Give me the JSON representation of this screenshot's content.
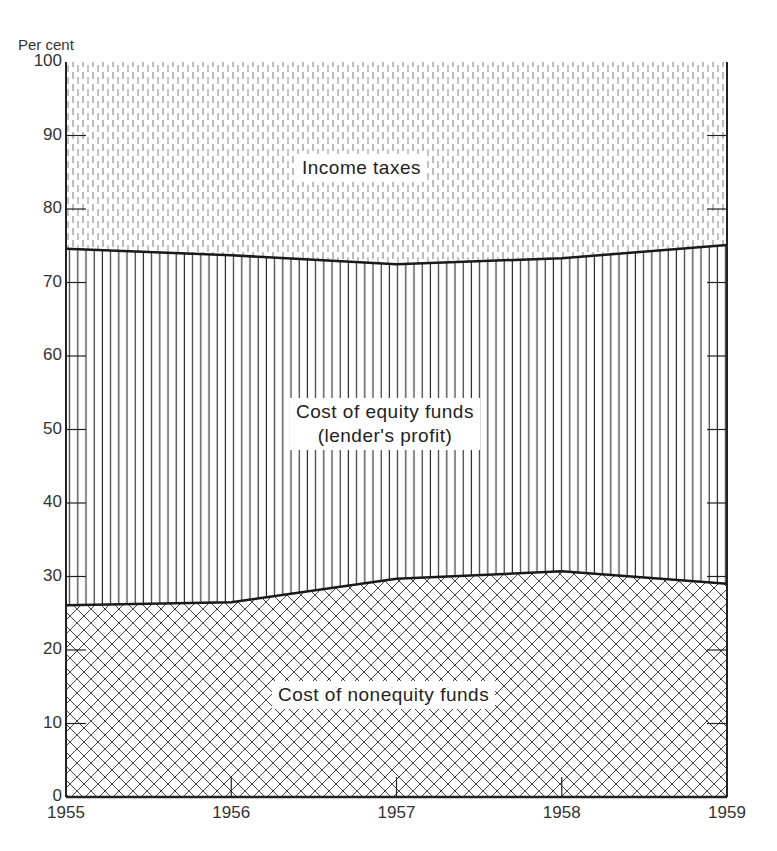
{
  "chart_data": {
    "type": "area",
    "stacked": true,
    "title": "",
    "xlabel": "",
    "ylabel": "Per cent",
    "x": [
      1955,
      1956,
      1957,
      1958,
      1959
    ],
    "ylim": [
      0,
      100
    ],
    "xlim": [
      1955,
      1959
    ],
    "yticks": [
      0,
      10,
      20,
      30,
      40,
      50,
      60,
      70,
      80,
      90,
      100
    ],
    "xticks": [
      1955,
      1956,
      1957,
      1958,
      1959
    ],
    "grid": false,
    "legend": "inline area labels",
    "series": [
      {
        "name": "Cost of nonequity funds",
        "values": [
          26.1,
          26.5,
          29.7,
          30.7,
          29.0
        ],
        "pattern": "crosshatch"
      },
      {
        "name": "Cost of equity funds (lender's profit)",
        "values": [
          48.5,
          47.2,
          42.8,
          42.6,
          46.1
        ],
        "pattern": "vertical-lines"
      },
      {
        "name": "Income taxes",
        "values": [
          25.4,
          26.3,
          27.5,
          26.7,
          24.9
        ],
        "pattern": "dashed-vertical"
      }
    ],
    "cumulative_boundaries": {
      "lower_line": [
        26.1,
        26.5,
        29.7,
        30.7,
        29.0
      ],
      "upper_line": [
        74.6,
        73.7,
        72.5,
        73.3,
        75.1
      ]
    }
  },
  "labels": {
    "ylabel": "Per cent",
    "income_taxes": "Income taxes",
    "equity_line1": "Cost of equity funds",
    "equity_line2": "(lender's profit)",
    "nonequity": "Cost of nonequity funds"
  },
  "ytick_labels": [
    "0",
    "10",
    "20",
    "30",
    "40",
    "50",
    "60",
    "70",
    "80",
    "90",
    "100"
  ],
  "xtick_labels": [
    "1955",
    "1956",
    "1957",
    "1958",
    "1959"
  ],
  "colors": {
    "line": "#1a1a1a",
    "background": "#ffffff",
    "text": "#333333"
  }
}
